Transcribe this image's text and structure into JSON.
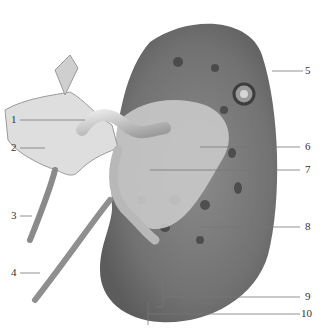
{
  "figure": {
    "labels": [
      {
        "num": "1"
      },
      {
        "num": "2"
      },
      {
        "num": "3"
      },
      {
        "num": "4"
      },
      {
        "num": "5"
      },
      {
        "num": "6"
      },
      {
        "num": "7"
      },
      {
        "num": "8"
      },
      {
        "num": "9"
      },
      {
        "num": "10"
      }
    ],
    "colors": {
      "cortex": "#7a7a7a",
      "cortex_dark": "#5e5e5e",
      "sinus": "#cfcfcf",
      "vessel": "#bdbdbd",
      "line": "#777777"
    }
  }
}
